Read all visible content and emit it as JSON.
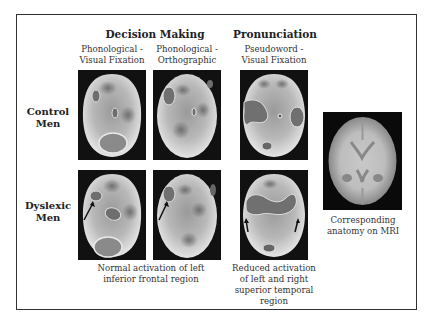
{
  "figure": {
    "column_groups": [
      {
        "label": "Decision Making"
      },
      {
        "label": "Pronunciation"
      }
    ],
    "columns": [
      {
        "label_line1": "Phonological -",
        "label_line2": "Visual Fixation"
      },
      {
        "label_line1": "Phonological -",
        "label_line2": "Orthographic"
      },
      {
        "label_line1": "Pseudoword -",
        "label_line2": "Visual Fixation"
      }
    ],
    "rows": [
      {
        "label_line1": "Control",
        "label_line2": "Men"
      },
      {
        "label_line1": "Dyslexic",
        "label_line2": "Men"
      }
    ],
    "captions": {
      "decision": {
        "line1": "Normal activation of left",
        "line2": "inferior frontal region"
      },
      "pronunciation": {
        "line1": "Reduced activation",
        "line2": "of left and right",
        "line3": "superior temporal",
        "line4": "region"
      },
      "mri": {
        "line1": "Corresponding",
        "line2": "anatomy on MRI"
      }
    },
    "colors": {
      "frame": "#333333",
      "activation": "#6e6e6e",
      "background_scan": "#111111"
    }
  }
}
